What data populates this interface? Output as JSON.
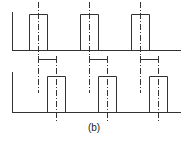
{
  "figure": {
    "label": "(b)",
    "pulse_count_per_train": 3,
    "upper_train": {
      "name": "reference-pulses",
      "pulses": [
        1,
        2,
        3
      ]
    },
    "lower_train": {
      "name": "shifted-pulses",
      "pulses": [
        1,
        2,
        3
      ]
    },
    "brackets": [
      1,
      2,
      3
    ]
  }
}
